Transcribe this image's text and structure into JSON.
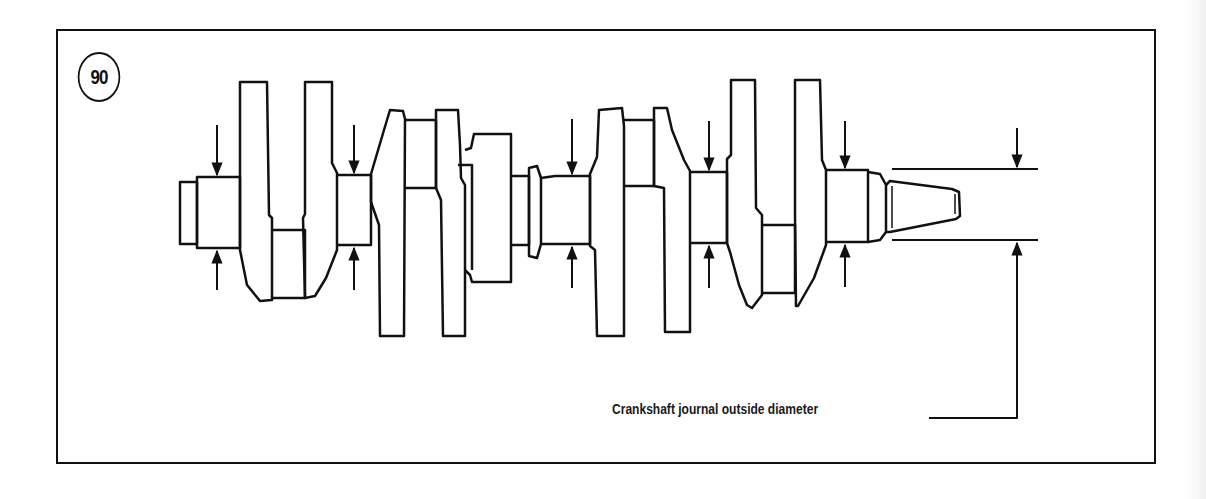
{
  "figure": {
    "number": "90",
    "caption": "Crankshaft journal outside diameter",
    "subject": "crankshaft",
    "measurement_points": 6,
    "colors": {
      "line": "#111111",
      "background": "#ffffff"
    }
  }
}
